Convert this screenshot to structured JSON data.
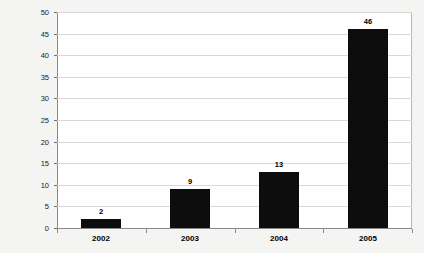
{
  "chart_data": {
    "type": "bar",
    "title": "",
    "xlabel": "",
    "ylabel": "",
    "categories": [
      "2002",
      "2003",
      "2004",
      "2005"
    ],
    "values": [
      2,
      9,
      13,
      46
    ],
    "ylim": [
      0,
      50
    ],
    "y_ticks": [
      0,
      5,
      10,
      15,
      20,
      25,
      30,
      35,
      40,
      45,
      50
    ],
    "y_tick_labels": [
      "0",
      "5",
      "10",
      "15",
      "20",
      "25",
      "30",
      "35",
      "40",
      "45",
      "50"
    ],
    "data_labels": [
      "2",
      "9",
      "13",
      "46"
    ],
    "grid": "horizontal",
    "legend": "none",
    "series": [
      {
        "name": "",
        "values": [
          2,
          9,
          13,
          46
        ]
      }
    ],
    "colors": {
      "bar": "#0d0d0d",
      "gridline": "#d9d9d9",
      "axis": "#8a8a8a",
      "plot_background": "#ffffff",
      "page_background": "#f4f4f2",
      "text": "#000000"
    }
  }
}
